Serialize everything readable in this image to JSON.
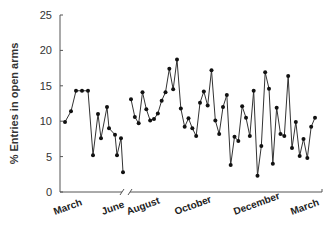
{
  "chart_data": {
    "type": "line",
    "title": "",
    "xlabel": "",
    "ylabel": "% Entries in open arms",
    "ylim": [
      0,
      25
    ],
    "yticks": [
      0,
      5,
      10,
      15,
      20,
      25
    ],
    "grid": false,
    "legend": "none",
    "axis_break": "between June and August",
    "x_month_labels": [
      "March",
      "June",
      "August",
      "October",
      "December",
      "March"
    ],
    "series": [
      {
        "name": "segment-1 (March–June)",
        "values": [
          9.9,
          11.4,
          14.3,
          14.3,
          14.3,
          5.2,
          11.0,
          7.6,
          12.0,
          9.0,
          8.1,
          5.2,
          7.6,
          2.8
        ]
      },
      {
        "name": "segment-2 (August–March)",
        "values": [
          13.1,
          10.6,
          9.7,
          14.1,
          11.7,
          10.1,
          10.3,
          11.1,
          12.9,
          14.1,
          17.4,
          14.5,
          18.7,
          11.8,
          9.2,
          10.4,
          9.0,
          7.9,
          12.6,
          14.2,
          12.2,
          17.2,
          10.1,
          8.2,
          12.0,
          13.7,
          3.8,
          7.8,
          7.2,
          12.1,
          10.5,
          7.9,
          14.3,
          2.3,
          6.5,
          16.9,
          14.6,
          4.0,
          11.9,
          8.2,
          7.9,
          16.4,
          6.2,
          9.9,
          5.1,
          7.5,
          4.8,
          9.2,
          10.5
        ]
      }
    ]
  }
}
